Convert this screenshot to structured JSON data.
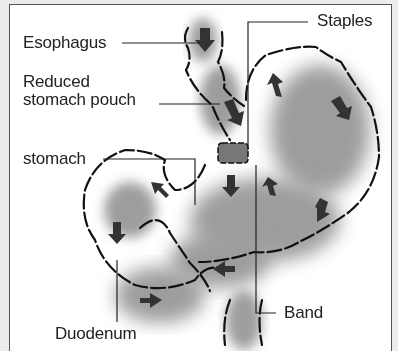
{
  "diagram": {
    "labels": {
      "esophagus": "Esophagus",
      "reduced_pouch_line1": "Reduced",
      "reduced_pouch_line2": "stomach pouch",
      "stomach": "stomach",
      "staples": "Staples",
      "band": "Band",
      "duodenum": "Duodenum"
    },
    "colors": {
      "outline": "#111111",
      "organ_fill": "#8a8a8a",
      "arrow": "#333333",
      "background": "#ffffff",
      "outer": "#ececec"
    }
  }
}
